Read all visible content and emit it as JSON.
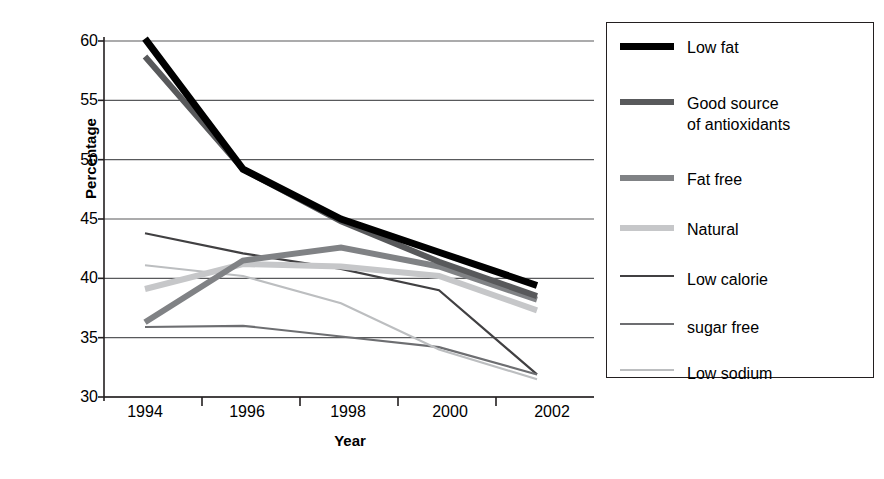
{
  "chart_data": {
    "type": "line",
    "title": "",
    "xlabel": "Year",
    "ylabel": "Percentage",
    "categories": [
      "1994",
      "1996",
      "1998",
      "2000",
      "2002"
    ],
    "ylim": [
      30,
      60
    ],
    "yticks": [
      30,
      35,
      40,
      45,
      50,
      55,
      60
    ],
    "grid": true,
    "legend_position": "right",
    "series": [
      {
        "name": "Low fat",
        "color": "#000000",
        "width": 7,
        "values": [
          60.2,
          49.2,
          45.0,
          42.2,
          39.4
        ]
      },
      {
        "name": "Good source\nof antioxidants",
        "color": "#58595b",
        "width": 6,
        "values": [
          58.7,
          49.2,
          44.8,
          41.4,
          38.5
        ]
      },
      {
        "name": "Fat free",
        "color": "#808285",
        "width": 6,
        "values": [
          36.3,
          41.5,
          42.6,
          41.0,
          38.2
        ]
      },
      {
        "name": "Natural",
        "color": "#c6c7c9",
        "width": 6,
        "values": [
          39.1,
          41.2,
          41.0,
          40.2,
          37.3
        ]
      },
      {
        "name": "Low calorie",
        "color": "#414042",
        "width": 2.2,
        "values": [
          43.8,
          42.1,
          40.8,
          39.0,
          31.9
        ]
      },
      {
        "name": "sugar free",
        "color": "#6d6e71",
        "width": 2.2,
        "values": [
          35.9,
          36.0,
          35.1,
          34.2,
          31.9
        ]
      },
      {
        "name": "Low sodium",
        "color": "#bcbec0",
        "width": 2.2,
        "values": [
          41.1,
          40.2,
          37.9,
          34.0,
          31.5
        ]
      }
    ]
  },
  "axis": {
    "y_labels": [
      "60",
      "55",
      "50",
      "45",
      "40",
      "35",
      "30"
    ],
    "x_labels": [
      "1994",
      "1996",
      "1998",
      "2000",
      "2002"
    ],
    "y_title": "Percentage",
    "x_title": "Year"
  },
  "legend": {
    "items": [
      {
        "label": "Low fat"
      },
      {
        "label": "Good source\nof antioxidants"
      },
      {
        "label": "Fat free"
      },
      {
        "label": "Natural"
      },
      {
        "label": "Low calorie"
      },
      {
        "label": "sugar free"
      },
      {
        "label": "Low sodium"
      }
    ]
  },
  "colors": {
    "axis": "#231f20",
    "grid": "#58595b",
    "background": "#ffffff"
  }
}
